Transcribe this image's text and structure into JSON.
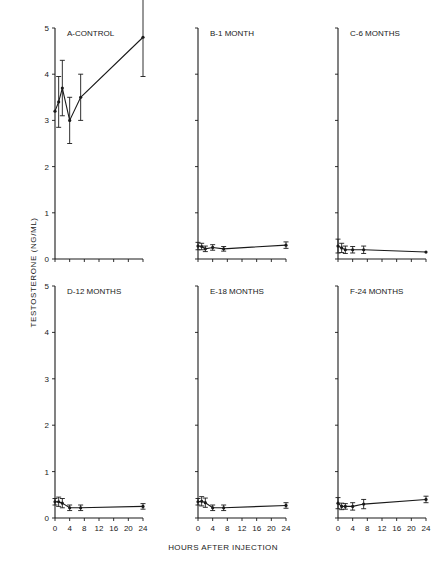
{
  "figure": {
    "ylabel": "TESTOSTERONE  (NG/ML)",
    "xlabel": "HOURS AFTER INJECTION"
  },
  "chart_data": [
    {
      "type": "line",
      "title": "A-CONTROL",
      "xlabel": "HOURS AFTER INJECTION",
      "ylabel": "TESTOSTERONE (NG/ML)",
      "x": [
        0,
        1,
        2,
        4,
        7,
        24
      ],
      "values": [
        3.2,
        3.4,
        3.7,
        3.0,
        3.5,
        4.8
      ],
      "error": [
        0.0,
        0.55,
        0.6,
        0.5,
        0.5,
        0.85
      ],
      "ylim": [
        0,
        5
      ],
      "xlim": [
        0,
        24
      ],
      "yticks": [
        0,
        1,
        2,
        3,
        4,
        5
      ],
      "xticks": [
        0,
        4,
        8,
        12,
        16,
        20,
        24
      ]
    },
    {
      "type": "line",
      "title": "B-1 MONTH",
      "x": [
        0,
        1,
        2,
        4,
        7,
        24
      ],
      "values": [
        0.28,
        0.27,
        0.22,
        0.25,
        0.22,
        0.3
      ],
      "error": [
        0.08,
        0.07,
        0.06,
        0.06,
        0.05,
        0.07
      ],
      "ylim": [
        0,
        5
      ],
      "xlim": [
        0,
        24
      ]
    },
    {
      "type": "line",
      "title": "C-6 MONTHS",
      "x": [
        0,
        1,
        2,
        4,
        7,
        24
      ],
      "values": [
        0.28,
        0.24,
        0.2,
        0.2,
        0.2,
        0.15
      ],
      "error": [
        0.15,
        0.1,
        0.08,
        0.07,
        0.08,
        0.0
      ],
      "ylim": [
        0,
        5
      ],
      "xlim": [
        0,
        24
      ]
    },
    {
      "type": "line",
      "title": "D-12 MONTHS",
      "x": [
        0,
        1,
        2,
        4,
        7,
        24
      ],
      "values": [
        0.35,
        0.35,
        0.32,
        0.22,
        0.22,
        0.25
      ],
      "error": [
        0.07,
        0.1,
        0.1,
        0.06,
        0.06,
        0.06
      ],
      "ylim": [
        0,
        5
      ],
      "xlim": [
        0,
        24
      ]
    },
    {
      "type": "line",
      "title": "E-18 MONTHS",
      "x": [
        0,
        1,
        2,
        4,
        7,
        24
      ],
      "values": [
        0.35,
        0.36,
        0.33,
        0.22,
        0.22,
        0.27
      ],
      "error": [
        0.07,
        0.1,
        0.1,
        0.06,
        0.06,
        0.06
      ],
      "ylim": [
        0,
        5
      ],
      "xlim": [
        0,
        24
      ]
    },
    {
      "type": "line",
      "title": "F-24 MONTHS",
      "x": [
        0,
        1,
        2,
        4,
        7,
        24
      ],
      "values": [
        0.32,
        0.25,
        0.25,
        0.25,
        0.3,
        0.4
      ],
      "error": [
        0.12,
        0.07,
        0.06,
        0.08,
        0.1,
        0.07
      ],
      "ylim": [
        0,
        5
      ],
      "xlim": [
        0,
        24
      ]
    }
  ],
  "layout": {
    "panels": [
      {
        "ox": 55,
        "oy": 259,
        "w": 88,
        "h": 231,
        "yticks": true,
        "xtickLabels": false
      },
      {
        "ox": 198,
        "oy": 259,
        "w": 88,
        "h": 231,
        "yticks": false,
        "xtickLabels": false
      },
      {
        "ox": 338,
        "oy": 259,
        "w": 88,
        "h": 231,
        "yticks": false,
        "xtickLabels": false
      },
      {
        "ox": 55,
        "oy": 518,
        "w": 88,
        "h": 232,
        "yticks": true,
        "xtickLabels": true
      },
      {
        "ox": 198,
        "oy": 518,
        "w": 88,
        "h": 232,
        "yticks": false,
        "xtickLabels": true
      },
      {
        "ox": 338,
        "oy": 518,
        "w": 88,
        "h": 232,
        "yticks": false,
        "xtickLabels": true
      }
    ],
    "ink": "#1a1a1a"
  }
}
